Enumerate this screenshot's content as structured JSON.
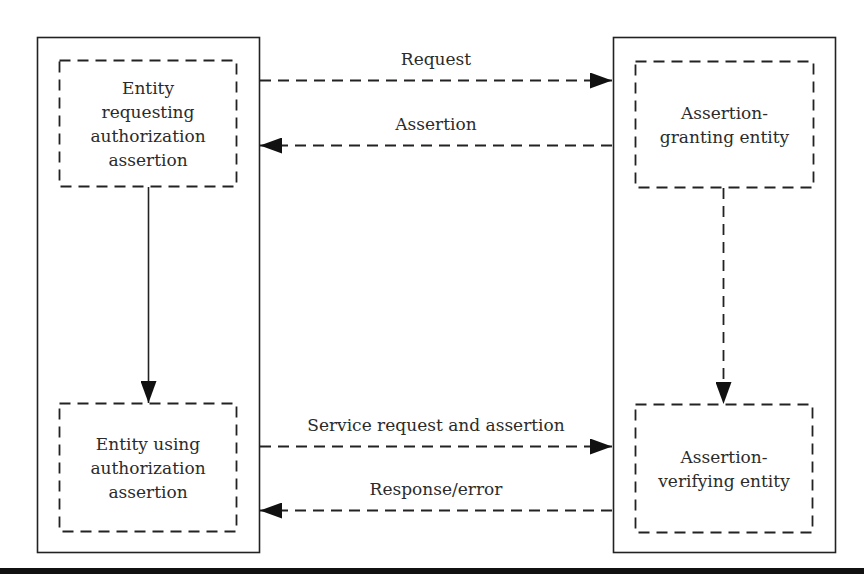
{
  "diagram": {
    "colors": {
      "line": "#222222",
      "text": "#2b2b2b",
      "background": "#ffffff"
    },
    "nodes": [
      {
        "id": "requester",
        "label": "Entity\nrequesting\nauthorization\nassertion",
        "group": "left",
        "border": "dashed"
      },
      {
        "id": "user",
        "label": "Entity using\nauthorization\nassertion",
        "group": "left",
        "border": "dashed"
      },
      {
        "id": "granter",
        "label": "Assertion-\ngranting entity",
        "group": "right",
        "border": "dashed"
      },
      {
        "id": "verifier",
        "label": "Assertion-\nverifying entity",
        "group": "right",
        "border": "dashed"
      }
    ],
    "containers": [
      {
        "id": "left",
        "border": "solid"
      },
      {
        "id": "right",
        "border": "solid"
      }
    ],
    "edges": [
      {
        "from": "requester",
        "to": "granter",
        "label": "Request",
        "style": "dashed"
      },
      {
        "from": "granter",
        "to": "requester",
        "label": "Assertion",
        "style": "dashed"
      },
      {
        "from": "requester",
        "to": "user",
        "label": "",
        "style": "solid"
      },
      {
        "from": "granter",
        "to": "verifier",
        "label": "",
        "style": "dashed"
      },
      {
        "from": "user",
        "to": "verifier",
        "label": "Service request and assertion",
        "style": "dashed"
      },
      {
        "from": "verifier",
        "to": "user",
        "label": "Response/error",
        "style": "dashed"
      }
    ]
  }
}
